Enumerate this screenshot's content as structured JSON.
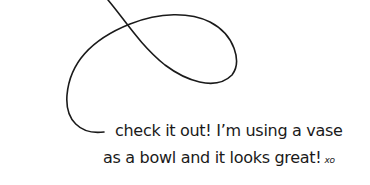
{
  "caption": {
    "line1": "check it out! I’m using a vase",
    "line2": "as a bowl and it looks great!",
    "signoff": "xo"
  },
  "colors": {
    "ink": "#1a1a1a",
    "background": "#ffffff"
  }
}
